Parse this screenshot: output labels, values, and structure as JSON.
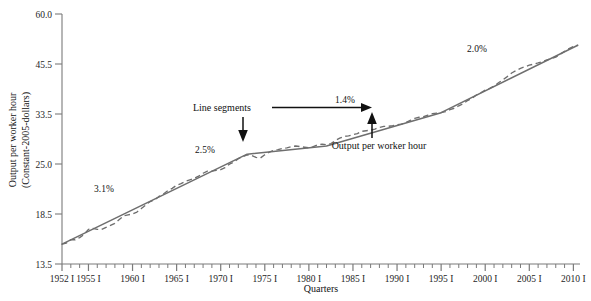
{
  "chart_data": {
    "type": "line",
    "title": "",
    "xlabel": "Quarters",
    "ylabel": "Output per worker hour (Constant-2005-dollars)",
    "ylabel_line1": "Output per worker hour",
    "ylabel_line2": "(Constant-2005-dollars)",
    "yscale": "log",
    "ylim": [
      13.5,
      60.0
    ],
    "ytick_values": [
      13.5,
      18.5,
      25.0,
      33.5,
      45.5,
      60.0
    ],
    "ytick_labels": [
      "13.5",
      "18.5",
      "25.0",
      "33.5",
      "45.5",
      "60.0"
    ],
    "xlim": [
      1952,
      2010.75
    ],
    "xtick_labels": [
      "1952 I",
      "1955 I",
      "1960 I",
      "1965 I",
      "1970 I",
      "1975 I",
      "1980 I",
      "1985 I",
      "1990 I",
      "1995 I",
      "2000 I",
      "2005 I",
      "2010 I"
    ],
    "xtick_values": [
      1952,
      1955,
      1960,
      1965,
      1970,
      1975,
      1980,
      1985,
      1990,
      1995,
      2000,
      2005,
      2010
    ],
    "xminor_step": 1,
    "grid": false,
    "legend": "none",
    "line_color": "#6e6e6e",
    "series": [
      {
        "name": "Output per worker hour",
        "style": "dashed",
        "color": "#6e6e6e",
        "x": [
          1952.0,
          1952.5,
          1953.0,
          1953.5,
          1954.0,
          1954.5,
          1955.0,
          1955.5,
          1956.0,
          1956.5,
          1957.0,
          1957.5,
          1958.0,
          1958.5,
          1959.0,
          1959.5,
          1960.0,
          1960.5,
          1961.0,
          1961.5,
          1962.0,
          1962.5,
          1963.0,
          1963.5,
          1964.0,
          1964.5,
          1965.0,
          1965.5,
          1966.0,
          1966.5,
          1967.0,
          1967.5,
          1968.0,
          1968.5,
          1969.0,
          1969.5,
          1970.0,
          1970.5,
          1971.0,
          1971.5,
          1972.0,
          1972.5,
          1973.0,
          1973.5,
          1974.0,
          1974.5,
          1975.0,
          1975.5,
          1976.0,
          1976.5,
          1977.0,
          1977.5,
          1978.0,
          1978.5,
          1979.0,
          1979.5,
          1980.0,
          1980.5,
          1981.0,
          1981.5,
          1982.0,
          1982.5,
          1983.0,
          1983.5,
          1984.0,
          1984.5,
          1985.0,
          1985.5,
          1986.0,
          1986.5,
          1987.0,
          1987.5,
          1988.0,
          1988.5,
          1989.0,
          1989.5,
          1990.0,
          1990.5,
          1991.0,
          1991.5,
          1992.0,
          1992.5,
          1993.0,
          1993.5,
          1994.0,
          1994.5,
          1995.0,
          1995.5,
          1996.0,
          1996.5,
          1997.0,
          1997.5,
          1998.0,
          1998.5,
          1999.0,
          1999.5,
          2000.0,
          2000.5,
          2001.0,
          2001.5,
          2002.0,
          2002.5,
          2003.0,
          2003.5,
          2004.0,
          2004.5,
          2005.0,
          2005.5,
          2006.0,
          2006.5,
          2007.0,
          2007.5,
          2008.0,
          2008.5,
          2009.0,
          2009.5,
          2010.0,
          2010.5
        ],
        "y": [
          15.2,
          15.3,
          15.6,
          15.6,
          15.8,
          16.1,
          16.6,
          16.7,
          16.6,
          16.6,
          16.8,
          17.0,
          17.2,
          17.6,
          18.0,
          18.1,
          18.2,
          18.4,
          18.8,
          19.2,
          19.6,
          19.8,
          20.2,
          20.5,
          20.9,
          21.2,
          21.6,
          21.8,
          22.1,
          22.3,
          22.5,
          22.8,
          23.2,
          23.5,
          23.5,
          23.6,
          23.7,
          24.0,
          24.5,
          24.8,
          25.3,
          25.6,
          25.9,
          25.8,
          25.5,
          25.4,
          25.9,
          26.3,
          26.6,
          26.7,
          26.9,
          27.0,
          27.2,
          27.3,
          27.2,
          27.1,
          27.0,
          27.2,
          27.5,
          27.6,
          27.5,
          27.7,
          28.2,
          28.6,
          28.9,
          29.0,
          29.2,
          29.4,
          29.8,
          29.9,
          30.0,
          30.2,
          30.5,
          30.7,
          30.7,
          30.8,
          31.0,
          31.1,
          31.4,
          31.8,
          32.2,
          32.4,
          32.5,
          32.8,
          33.1,
          33.2,
          33.3,
          33.5,
          33.9,
          34.2,
          34.7,
          35.1,
          35.8,
          36.3,
          37.0,
          37.5,
          38.1,
          38.5,
          39.0,
          39.8,
          40.5,
          41.3,
          42.2,
          42.8,
          43.4,
          43.8,
          44.2,
          44.5,
          44.8,
          45.2,
          45.6,
          46.0,
          46.4,
          47.2,
          48.0,
          48.8,
          49.4,
          49.8
        ]
      },
      {
        "name": "Line segments",
        "style": "solid",
        "color": "#6e6e6e",
        "breakpoints": [
          {
            "x": 1952.0,
            "y": 15.2
          },
          {
            "x": 1973.0,
            "y": 26.0
          },
          {
            "x": 1982.0,
            "y": 27.3
          },
          {
            "x": 1995.0,
            "y": 33.3
          },
          {
            "x": 2010.5,
            "y": 49.8
          }
        ]
      }
    ],
    "annotations": [
      {
        "id": "growth-1",
        "text": "3.1%",
        "x": 1959.5,
        "y_px": 189,
        "x_px": 104
      },
      {
        "id": "growth-2",
        "text": "2.5%",
        "x": 1969.5,
        "y_px": 150,
        "x_px": 205
      },
      {
        "id": "growth-3",
        "text": "1.4%",
        "x": 1983.0,
        "y_px": 100,
        "x_px": 337
      },
      {
        "id": "growth-4",
        "text": "2.0%",
        "x": 2000.0,
        "y_px": 49,
        "x_px": 470
      },
      {
        "id": "line-segments-callout",
        "text": "Line segments",
        "x_px": 224,
        "y_px": 108
      },
      {
        "id": "output-per-worker-hour-callout",
        "text": "Output per worker hour",
        "x_px": 379,
        "y_px": 146
      }
    ]
  },
  "axes": {
    "y_title_line1": "Output per worker hour",
    "y_title_line2": "(Constant-2005-dollars)",
    "x_title": "Quarters"
  },
  "labels": {
    "y_ticks": [
      "60.0",
      "45.5",
      "33.5",
      "25.0",
      "18.5",
      "13.5"
    ],
    "x_ticks": [
      "1952 I",
      "1955 I",
      "1960 I",
      "1965 I",
      "1970 I",
      "1975 I",
      "1980 I",
      "1985 I",
      "1990 I",
      "1995 I",
      "2000 I",
      "2005 I",
      "2010 I"
    ],
    "pct": [
      "3.1%",
      "2.5%",
      "1.4%",
      "2.0%"
    ],
    "callout_segments": "Line segments",
    "callout_series": "Output per worker hour"
  }
}
